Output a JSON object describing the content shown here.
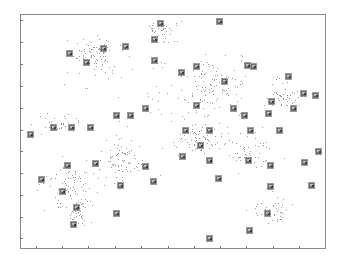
{
  "chart_data": {
    "type": "scatter",
    "title": "",
    "xlabel": "",
    "ylabel": "",
    "grid": false,
    "legend": null,
    "x_ticks_px": [
      36,
      62,
      88,
      115,
      141,
      168,
      194,
      220,
      246,
      273,
      299
    ],
    "y_ticks_px": [
      20,
      42,
      64,
      86,
      108,
      130,
      151,
      173,
      195,
      217,
      238
    ],
    "x_tick_labels": [
      "",
      "",
      "",
      "",
      "",
      "",
      "",
      "",
      "",
      "",
      ""
    ],
    "y_tick_labels": [
      "",
      "",
      "",
      "",
      "",
      "",
      "",
      "",
      "",
      "",
      ""
    ],
    "point_color": "#777777",
    "thumbnail_color": "#6e6e6e",
    "clusters": [
      {
        "cx": 95,
        "cy": 55,
        "rx": 30,
        "ry": 20,
        "n": 90
      },
      {
        "cx": 160,
        "cy": 30,
        "rx": 18,
        "ry": 12,
        "n": 40
      },
      {
        "cx": 215,
        "cy": 85,
        "rx": 30,
        "ry": 25,
        "n": 100
      },
      {
        "cx": 283,
        "cy": 95,
        "rx": 18,
        "ry": 16,
        "n": 50
      },
      {
        "cx": 70,
        "cy": 185,
        "rx": 28,
        "ry": 22,
        "n": 80
      },
      {
        "cx": 120,
        "cy": 160,
        "rx": 25,
        "ry": 22,
        "n": 80
      },
      {
        "cx": 80,
        "cy": 210,
        "rx": 12,
        "ry": 20,
        "n": 40
      },
      {
        "cx": 270,
        "cy": 210,
        "rx": 20,
        "ry": 16,
        "n": 40
      },
      {
        "cx": 200,
        "cy": 140,
        "rx": 25,
        "ry": 16,
        "n": 60
      },
      {
        "cx": 250,
        "cy": 150,
        "rx": 25,
        "ry": 16,
        "n": 50
      },
      {
        "cx": 60,
        "cy": 125,
        "rx": 25,
        "ry": 10,
        "n": 30
      },
      {
        "cx": 170,
        "cy": 115,
        "rx": 70,
        "ry": 50,
        "n": 60
      }
    ],
    "thumbnails": [
      [
        219,
        21
      ],
      [
        160,
        23
      ],
      [
        154,
        39
      ],
      [
        125,
        46
      ],
      [
        103,
        48
      ],
      [
        69,
        53
      ],
      [
        86,
        62
      ],
      [
        154,
        60
      ],
      [
        196,
        66
      ],
      [
        247,
        65
      ],
      [
        253,
        66
      ],
      [
        288,
        76
      ],
      [
        303,
        93
      ],
      [
        315,
        95
      ],
      [
        271,
        101
      ],
      [
        181,
        72
      ],
      [
        224,
        81
      ],
      [
        233,
        108
      ],
      [
        196,
        105
      ],
      [
        244,
        115
      ],
      [
        268,
        113
      ],
      [
        293,
        108
      ],
      [
        145,
        108
      ],
      [
        130,
        115
      ],
      [
        116,
        115
      ],
      [
        90,
        127
      ],
      [
        71,
        127
      ],
      [
        53,
        127
      ],
      [
        30,
        134
      ],
      [
        185,
        130
      ],
      [
        209,
        130
      ],
      [
        250,
        130
      ],
      [
        279,
        130
      ],
      [
        318,
        151
      ],
      [
        200,
        145
      ],
      [
        182,
        156
      ],
      [
        95,
        163
      ],
      [
        145,
        166
      ],
      [
        67,
        165
      ],
      [
        209,
        160
      ],
      [
        248,
        160
      ],
      [
        270,
        165
      ],
      [
        304,
        162
      ],
      [
        41,
        179
      ],
      [
        62,
        191
      ],
      [
        120,
        185
      ],
      [
        153,
        181
      ],
      [
        218,
        178
      ],
      [
        270,
        186
      ],
      [
        311,
        185
      ],
      [
        76,
        207
      ],
      [
        116,
        213
      ],
      [
        73,
        224
      ],
      [
        267,
        213
      ],
      [
        249,
        230
      ],
      [
        209,
        238
      ]
    ]
  }
}
